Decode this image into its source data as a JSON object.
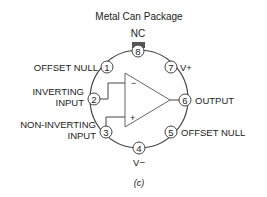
{
  "diagram": {
    "title": "Metal Can Package",
    "caption": "(c)",
    "component": "op-amp",
    "nc_label": "NC",
    "pins": [
      {
        "number": "1",
        "label": "OFFSET NULL"
      },
      {
        "number": "2",
        "label_line1": "INVERTING",
        "label_line2": "INPUT"
      },
      {
        "number": "3",
        "label_line1": "NON-INVERTING",
        "label_line2": "INPUT"
      },
      {
        "number": "4",
        "label": "V−"
      },
      {
        "number": "5",
        "label": "OFFSET NULL"
      },
      {
        "number": "6",
        "label": "OUTPUT"
      },
      {
        "number": "7",
        "label": "V+"
      },
      {
        "number": "8",
        "label": "NC"
      }
    ],
    "inverting_symbol": "−",
    "noninverting_symbol": "+",
    "colors": {
      "line": "#444444",
      "tab": "#555555",
      "text": "#222222"
    }
  }
}
